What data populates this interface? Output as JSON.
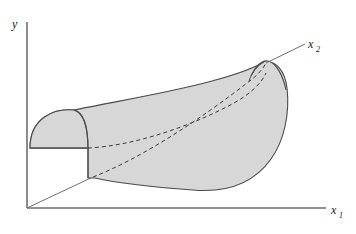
{
  "figure": {
    "kind": "3d-surface-plot",
    "background_color": "#ffffff",
    "axes": {
      "vertical": {
        "name": "y-axis",
        "label": "y",
        "label_x": 14,
        "label_y": 26,
        "x1": 27,
        "y1": 208,
        "x2": 27,
        "y2": 22
      },
      "horizontal": {
        "name": "x1-axis",
        "label": "x",
        "subscript": "1",
        "label_x": 333,
        "label_y": 213,
        "x1": 27,
        "y1": 208,
        "x2": 326,
        "y2": 208
      },
      "depth": {
        "name": "x2-axis",
        "label": "x",
        "subscript": "2",
        "label_x": 311,
        "label_y": 50,
        "x1": 27,
        "y1": 208,
        "x2": 307,
        "y2": 55
      }
    },
    "surface": {
      "name": "curved-response-surface",
      "fill_color": "#d7d7d7",
      "stroke_color": "#4a4a4a",
      "stroke_width": 1,
      "hidden_line_style": "dashed",
      "hidden_line_dash": "4,3",
      "outline_path": "M 30 148 C 30 118 56 110 73 111 C 108 104 170 95 214 82 C 241 74 257 68 266 63 C 278 61 286 72 287 88 C 289 112 285 139 273 158 C 257 182 232 192 196 189 C 152 186 118 182 96 178 L 88 178 L 88 148 Z",
      "left_cap_path": "M 30 148 C 30 118 56 110 73 111 C 83 112 88 124 88 148 Z",
      "left_cap_inner": "M 30 148 L 88 148",
      "right_dome_path": "M 253 74 C 258 66 263 61 268 62 C 275 64 281 74 284 87",
      "ridge_path": "M 266 63 C 259 66 254 72 250 80",
      "dashed_lines": [
        {
          "name": "hidden-contour-lower",
          "path": "M 88 148 C 130 146 190 128 236 103 C 252 94 262 84 268 74"
        },
        {
          "name": "hidden-contour-diagonal",
          "path": "M 92 178 C 140 160 200 120 248 84 C 258 77 264 70 268 64"
        }
      ],
      "leader_line": {
        "name": "x2-leader-line",
        "x1": 268,
        "y1": 64,
        "x2": 306,
        "y2": 44
      },
      "origin_ray": {
        "name": "origin-to-surface-ray",
        "x1": 27,
        "y1": 208,
        "x2": 92,
        "y2": 178
      }
    }
  }
}
